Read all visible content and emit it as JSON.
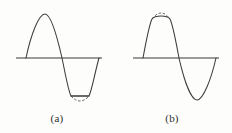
{
  "figure": {
    "background_color": "#fdfdfb",
    "stroke_color": "#3b3b3b",
    "dashed_stroke_color": "#5a5a5a",
    "panel_count": 2
  },
  "panels": [
    {
      "id": "a",
      "caption": "(a)",
      "clipped_half": "negative",
      "clipping_visible": true,
      "axis": {
        "y": 58,
        "x_start": 16,
        "x_end": 102
      },
      "waveform": {
        "x_start": 26,
        "x_end": 99,
        "positive_peak_x": 45,
        "positive_peak_y": 14,
        "zero_crossing_x": 62,
        "negative_trough_x": 80,
        "clip_level_y": 96,
        "unclipped_trough_y": 103,
        "clip_flat_x_start": 71,
        "clip_flat_x_end": 89
      }
    },
    {
      "id": "b",
      "caption": "(b)",
      "clipped_half": "positive",
      "clipping_visible": true,
      "axis": {
        "y": 58,
        "x_start": 133,
        "x_end": 219
      },
      "waveform": {
        "x_start": 143,
        "x_end": 216,
        "positive_peak_x": 161,
        "clip_level_y": 17,
        "unclipped_peak_y": 9,
        "clip_flat_x_start": 152,
        "clip_flat_x_end": 170,
        "zero_crossing_x": 179,
        "negative_trough_x": 197,
        "negative_trough_y": 100
      }
    }
  ],
  "captions": {
    "a": "(a)",
    "b": "(b)"
  }
}
